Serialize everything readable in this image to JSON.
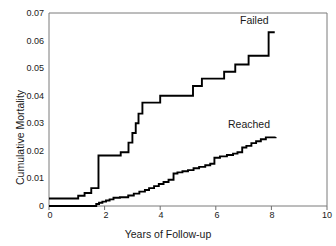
{
  "chart_data": {
    "type": "line",
    "title": "",
    "xlabel": "Years of Follow-up",
    "ylabel": "Cumulative Mortality",
    "xlim": [
      0,
      10
    ],
    "ylim": [
      0,
      0.07
    ],
    "grid": false,
    "legend_position": "inline-annotations",
    "xticks": [
      "0",
      "2",
      "4",
      "6",
      "8",
      "10"
    ],
    "xtick_values": [
      0,
      2,
      4,
      6,
      8,
      10
    ],
    "yticks": [
      "0",
      "0.01",
      "0.02",
      "0.03",
      "0.04",
      "0.05",
      "0.06",
      "0.07"
    ],
    "ytick_values": [
      0,
      0.01,
      0.02,
      0.03,
      0.04,
      0.05,
      0.06,
      0.07
    ],
    "step_style": "post",
    "series": [
      {
        "name": "Failed",
        "annotation": "Failed",
        "annotation_x": 7.25,
        "annotation_y": 0.0655,
        "color": "#000000",
        "x": [
          0.0,
          1.05,
          1.28,
          1.52,
          1.78,
          2.58,
          2.86,
          3.0,
          3.12,
          3.22,
          3.36,
          4.0,
          5.18,
          5.5,
          6.3,
          6.7,
          7.18,
          7.9,
          8.12
        ],
        "y": [
          0.0027,
          0.0037,
          0.0047,
          0.0065,
          0.0183,
          0.0195,
          0.023,
          0.0265,
          0.03,
          0.0335,
          0.0375,
          0.04,
          0.0435,
          0.0462,
          0.0487,
          0.0513,
          0.0545,
          0.063,
          0.063
        ]
      },
      {
        "name": "Reached",
        "annotation": "Reached",
        "annotation_x": 5.95,
        "annotation_y": 0.0295,
        "color": "#000000",
        "x": [
          0.0,
          1.55,
          1.7,
          1.8,
          1.92,
          2.05,
          2.18,
          2.32,
          2.55,
          2.85,
          3.05,
          3.25,
          3.45,
          3.6,
          3.78,
          3.95,
          4.12,
          4.3,
          4.48,
          4.62,
          4.8,
          5.0,
          5.2,
          5.4,
          5.62,
          5.8,
          5.95,
          6.15,
          6.4,
          6.62,
          6.78,
          6.95,
          7.1,
          7.28,
          7.45,
          7.62,
          7.8,
          8.15
        ],
        "y": [
          0.0,
          0.0,
          0.0007,
          0.0012,
          0.0016,
          0.002,
          0.0024,
          0.003,
          0.0032,
          0.0038,
          0.0045,
          0.0052,
          0.0058,
          0.0065,
          0.0072,
          0.008,
          0.0087,
          0.0095,
          0.0118,
          0.0122,
          0.0126,
          0.013,
          0.0137,
          0.0142,
          0.0148,
          0.0153,
          0.0175,
          0.018,
          0.0185,
          0.019,
          0.0195,
          0.0212,
          0.0218,
          0.0228,
          0.0235,
          0.0242,
          0.0249,
          0.025
        ]
      }
    ]
  },
  "axis": {
    "ylabel": "Cumulative Mortality",
    "xlabel": "Years of Follow-up"
  },
  "annotations": {
    "failed": "Failed",
    "reached": "Reached"
  },
  "ytick_labels": {
    "t0": "0",
    "t1": "0.01",
    "t2": "0.02",
    "t3": "0.03",
    "t4": "0.04",
    "t5": "0.05",
    "t6": "0.06",
    "t7": "0.07"
  },
  "xtick_labels": {
    "t0": "0",
    "t1": "2",
    "t2": "4",
    "t3": "6",
    "t4": "8",
    "t5": "10"
  },
  "colors": {
    "line": "#000000",
    "axis": "#6e6e6e",
    "text": "#1a1a1a",
    "background": "#ffffff"
  }
}
